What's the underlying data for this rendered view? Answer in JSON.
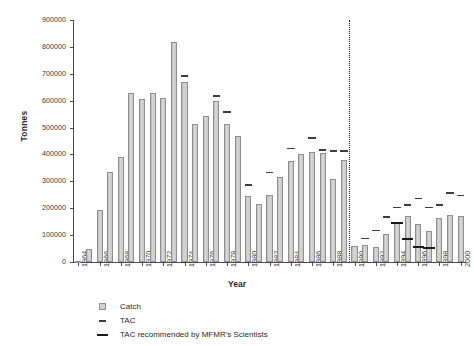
{
  "chart_data": {
    "type": "bar",
    "title": "",
    "xlabel": "Year",
    "ylabel": "Tonnes",
    "ylim": [
      0,
      900000
    ],
    "ytick_step": 100000,
    "yticks": [
      0,
      100000,
      200000,
      300000,
      400000,
      500000,
      600000,
      700000,
      800000,
      900000
    ],
    "ytick_labels": [
      "0",
      "100000",
      "200000",
      "300000",
      "400000",
      "500000",
      "600000",
      "700000",
      "800000",
      "900000"
    ],
    "grid": false,
    "legend_position": "below-left",
    "x": [
      1964,
      1965,
      1966,
      1967,
      1968,
      1969,
      1970,
      1971,
      1972,
      1973,
      1974,
      1975,
      1976,
      1977,
      1978,
      1979,
      1980,
      1981,
      1982,
      1983,
      1984,
      1985,
      1986,
      1987,
      1988,
      1989,
      1990,
      1991,
      1992,
      1993,
      1994,
      1995,
      1996,
      1997,
      1998,
      1999,
      2000
    ],
    "xtick_labels": [
      "1964",
      "1966",
      "1968",
      "1970",
      "1972",
      "1974",
      "1976",
      "1978",
      "1980",
      "1982",
      "1984",
      "1986",
      "1988",
      "1990",
      "1992",
      "1994",
      "1996",
      "1998",
      "2000"
    ],
    "xtick_years": [
      1964,
      1966,
      1968,
      1970,
      1972,
      1974,
      1976,
      1978,
      1980,
      1982,
      1984,
      1986,
      1988,
      1990,
      1992,
      1994,
      1996,
      1998,
      2000
    ],
    "series": [
      {
        "name": "Catch",
        "render": "bar",
        "color": "#c9c9c9",
        "edge_color": "#8f8f8f",
        "values": [
          5000,
          48000,
          192000,
          335000,
          392000,
          630000,
          605000,
          630000,
          610000,
          820000,
          670000,
          515000,
          545000,
          600000,
          515000,
          470000,
          245000,
          215000,
          250000,
          315000,
          375000,
          400000,
          410000,
          405000,
          310000,
          380000,
          60000,
          65000,
          55000,
          105000,
          145000,
          170000,
          140000,
          115000,
          165000,
          175000,
          170000
        ]
      },
      {
        "name": "TAC",
        "render": "dash",
        "color": "#3d3d3d",
        "values": [
          null,
          null,
          null,
          null,
          null,
          null,
          null,
          null,
          null,
          null,
          695000,
          null,
          null,
          620000,
          560000,
          null,
          290000,
          null,
          335000,
          null,
          425000,
          null,
          465000,
          420000,
          415000,
          415000,
          null,
          90000,
          120000,
          170000,
          205000,
          215000,
          240000,
          205000,
          215000,
          260000,
          250000
        ]
      },
      {
        "name": "TAC recommended by MFMR's Scientists",
        "render": "thick-dash",
        "color": "#1a1a1a",
        "values": [
          null,
          null,
          null,
          null,
          null,
          null,
          null,
          null,
          null,
          null,
          null,
          null,
          null,
          null,
          null,
          null,
          null,
          null,
          null,
          null,
          null,
          null,
          null,
          null,
          null,
          null,
          null,
          null,
          null,
          null,
          150000,
          90000,
          60000,
          55000,
          null,
          null,
          null
        ]
      }
    ],
    "annotations": [
      {
        "type": "vertical-dotted-line",
        "label": "independence-divider",
        "x_between": [
          1989,
          1990
        ]
      }
    ]
  },
  "legend": {
    "items": [
      {
        "label": "Catch",
        "swatch": "square-swatch-icon"
      },
      {
        "label": "TAC",
        "swatch": "short-dash-icon"
      },
      {
        "label": "TAC recommended by MFMR's Scientists",
        "swatch": "long-dash-icon"
      }
    ]
  }
}
